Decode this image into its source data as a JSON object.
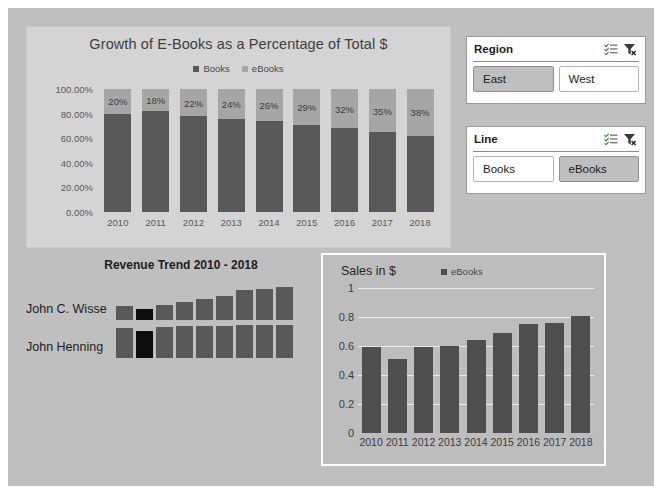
{
  "theme": {
    "canvas_bg": "#bfbfbf",
    "panel_bg": "#d4d4d4",
    "books_color": "#595959",
    "ebooks_color": "#a6a6a6",
    "sales_bar_color": "#4f4f4f",
    "sparkline_color": "#595959",
    "sparkline_low_color": "#0d0d0d",
    "selected_slicer_bg": "#bfbfbf"
  },
  "slicers": [
    {
      "name": "region",
      "title": "Region",
      "multiselect_icon": "multi-select-icon",
      "clear_filter_icon": "clear-filter-icon",
      "items": [
        {
          "label": "East",
          "selected": true
        },
        {
          "label": "West",
          "selected": false
        }
      ]
    },
    {
      "name": "line",
      "title": "Line",
      "multiselect_icon": "multi-select-icon",
      "clear_filter_icon": "clear-filter-icon",
      "items": [
        {
          "label": "Books",
          "selected": false
        },
        {
          "label": "eBooks",
          "selected": true
        }
      ]
    }
  ],
  "trend": {
    "title": "Revenue Trend 2010 - 2018",
    "rows": [
      {
        "label": "John C. Wisse",
        "values": [
          0.42,
          0.33,
          0.45,
          0.53,
          0.61,
          0.72,
          0.88,
          0.92,
          0.97
        ],
        "low_index": 1
      },
      {
        "label": "John Henning",
        "values": [
          0.88,
          0.8,
          0.92,
          0.93,
          0.95,
          0.94,
          0.96,
          0.97,
          0.98
        ],
        "low_index": 1
      }
    ]
  },
  "chart_data": [
    {
      "id": "stacked-growth",
      "type": "bar",
      "stacked": true,
      "title": "Growth of E-Books as a Percentage of Total $",
      "xlabel": "",
      "ylabel": "",
      "categories": [
        "2010",
        "2011",
        "2012",
        "2013",
        "2014",
        "2015",
        "2016",
        "2017",
        "2018"
      ],
      "ytick_labels": [
        "100.00%",
        "80.00%",
        "60.00%",
        "40.00%",
        "20.00%",
        "0.00%"
      ],
      "ytick_values": [
        1.0,
        0.8,
        0.6,
        0.4,
        0.2,
        0.0
      ],
      "ylim": [
        0,
        1
      ],
      "grid": false,
      "legend": [
        "Books",
        "eBooks"
      ],
      "legend_position": "top",
      "series": [
        {
          "name": "Books",
          "values": [
            0.8,
            0.82,
            0.78,
            0.76,
            0.74,
            0.71,
            0.68,
            0.65,
            0.62
          ]
        },
        {
          "name": "eBooks",
          "values": [
            0.2,
            0.18,
            0.22,
            0.24,
            0.26,
            0.29,
            0.32,
            0.35,
            0.38
          ]
        }
      ],
      "data_labels": [
        "20%",
        "18%",
        "22%",
        "24%",
        "26%",
        "29%",
        "32%",
        "35%",
        "38%"
      ]
    },
    {
      "id": "sales-ebooks",
      "type": "bar",
      "stacked": false,
      "title": "Sales in $",
      "xlabel": "",
      "ylabel": "",
      "categories": [
        "2010",
        "2011",
        "2012",
        "2013",
        "2014",
        "2015",
        "2016",
        "2017",
        "2018"
      ],
      "ytick_labels": [
        "1",
        "0.8",
        "0.6",
        "0.4",
        "0.2",
        "0"
      ],
      "ytick_values": [
        1,
        0.8,
        0.6,
        0.4,
        0.2,
        0
      ],
      "ylim": [
        0,
        1
      ],
      "grid": true,
      "legend": [
        "eBooks"
      ],
      "legend_position": "top",
      "series": [
        {
          "name": "eBooks",
          "values": [
            0.59,
            0.51,
            0.59,
            0.6,
            0.64,
            0.69,
            0.75,
            0.76,
            0.81
          ]
        }
      ]
    }
  ]
}
